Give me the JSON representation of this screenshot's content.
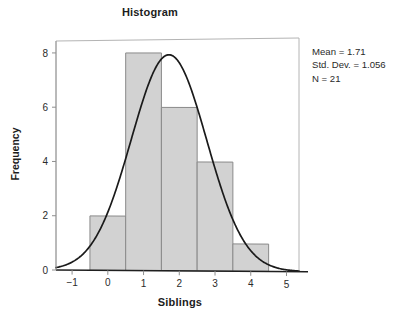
{
  "chart_data": {
    "type": "bar",
    "title": "Histogram",
    "xlabel": "Siblings",
    "ylabel": "Frequency",
    "categories": [
      0,
      1,
      2,
      3,
      4
    ],
    "values": [
      2,
      8,
      6,
      4,
      1
    ],
    "bin_width": 1,
    "xlim": [
      -1.45,
      5.35
    ],
    "ylim": [
      0,
      8.55
    ],
    "xticks": [
      "−1",
      "0",
      "1",
      "2",
      "3",
      "4",
      "5"
    ],
    "xtick_values": [
      -1,
      0,
      1,
      2,
      3,
      4,
      5
    ],
    "yticks": [
      "0",
      "2",
      "4",
      "6",
      "8"
    ],
    "ytick_values": [
      0,
      2,
      4,
      6,
      8
    ],
    "grid": false,
    "legend": "none",
    "bar_color": "#d2d2d2",
    "bar_edge_color": "#8a8a8a",
    "curve_color": "#1a1a1a",
    "overlay": {
      "name": "normal-curve",
      "distribution": "normal",
      "mean": 1.71,
      "std_dev": 1.056,
      "n": 21,
      "peak_value": 7.83
    },
    "annotations": {
      "mean_line": "Mean = 1.71",
      "std_dev_line": "Std. Dev. = 1.056",
      "n_line": "N = 21"
    }
  },
  "stats": {
    "mean": "Mean = 1.71",
    "std_dev": "Std. Dev. = 1.056",
    "n": "N = 21"
  },
  "axes": {
    "x_title": "Siblings",
    "y_title": "Frequency"
  },
  "title": "Histogram"
}
